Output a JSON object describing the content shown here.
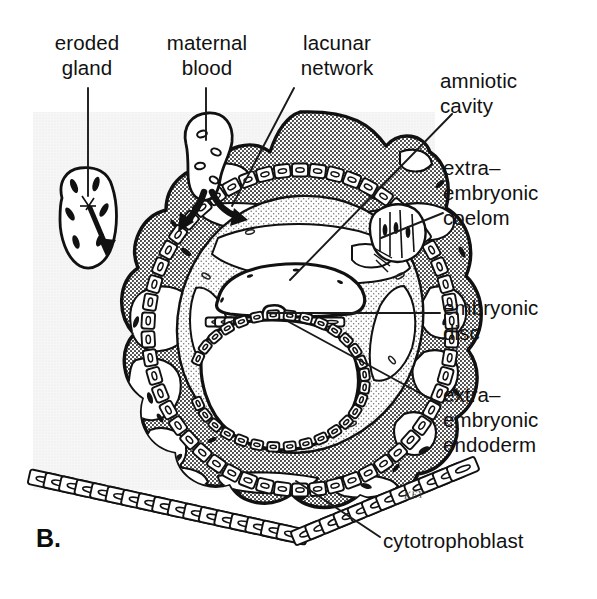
{
  "figure": {
    "panel_letter": "B.",
    "signature": "KEY",
    "background_color": "#ffffff",
    "panel_tint_color": "#ebebeb",
    "ink_color": "#111111",
    "syncytiotrophoblast_color": "#8a8a8a",
    "mesoderm_color": "#c9c9c9",
    "cell_fill_color": "#ffffff"
  },
  "labels": [
    {
      "id": "eroded-gland",
      "text": "eroded\ngland",
      "x": 28,
      "y": 30,
      "w": 118,
      "align": "center"
    },
    {
      "id": "maternal-blood",
      "text": "maternal\nblood",
      "x": 148,
      "y": 30,
      "w": 118,
      "align": "center"
    },
    {
      "id": "lacunar-network",
      "text": "lacunar\nnetwork",
      "x": 272,
      "y": 30,
      "w": 130,
      "align": "center"
    },
    {
      "id": "amniotic-cavity",
      "text": "amniotic\ncavity",
      "x": 440,
      "y": 68,
      "w": 130,
      "align": "left"
    },
    {
      "id": "extraembryonic-coelom",
      "text": "extra–\nembryonic\ncoelom",
      "x": 443,
      "y": 155,
      "w": 145,
      "align": "left"
    },
    {
      "id": "embryonic-disc",
      "text": "embryonic\ndisc",
      "x": 443,
      "y": 295,
      "w": 145,
      "align": "left"
    },
    {
      "id": "extraembryonic-endoderm",
      "text": "extra–\nembryonic\nendoderm",
      "x": 443,
      "y": 382,
      "w": 152,
      "align": "left"
    },
    {
      "id": "cytotrophoblast",
      "text": "cytotrophoblast",
      "x": 383,
      "y": 528,
      "w": 215,
      "align": "left"
    }
  ],
  "leader_lines": [
    {
      "id": "leader-eroded-gland",
      "points": "88,88 88,196"
    },
    {
      "id": "leader-maternal-blood",
      "points": "206,88 206,140"
    },
    {
      "id": "leader-lacunar-network",
      "points": "294,88 232,206"
    },
    {
      "id": "leader-amniotic-cavity",
      "points": "452,114 290,280"
    },
    {
      "id": "leader-extraembryonic-coelom",
      "points": "443,213 381,238"
    },
    {
      "id": "leader-embryonic-disc",
      "points": "440,313 268,313"
    },
    {
      "id": "leader-extraembryonic-endoderm",
      "points": "440,404 289,322"
    },
    {
      "id": "leader-cytotrophoblast",
      "points": "380,537 296,481"
    }
  ],
  "structures": [
    {
      "id": "syncytiotrophoblast",
      "name": "syncytiotrophoblast"
    },
    {
      "id": "lacunae",
      "name": "lacunar-spaces"
    },
    {
      "id": "cytotrophoblast",
      "name": "cytotrophoblast-cell-layer"
    },
    {
      "id": "extraembryonic-mesoderm",
      "name": "extra-embryonic-mesoderm"
    },
    {
      "id": "extraembryonic-coelom",
      "name": "extra-embryonic-coelom"
    },
    {
      "id": "amniotic-cavity",
      "name": "amniotic-cavity"
    },
    {
      "id": "embryonic-disc",
      "name": "embryonic-disc"
    },
    {
      "id": "yolk-sac",
      "name": "primary-yolk-sac"
    },
    {
      "id": "extraembryonic-endoderm",
      "name": "extra-embryonic-endoderm"
    },
    {
      "id": "eroded-gland",
      "name": "eroded-uterine-gland"
    },
    {
      "id": "maternal-vessel",
      "name": "maternal-blood-vessel"
    },
    {
      "id": "uterine-epithelium",
      "name": "uterine-epithelium"
    }
  ]
}
